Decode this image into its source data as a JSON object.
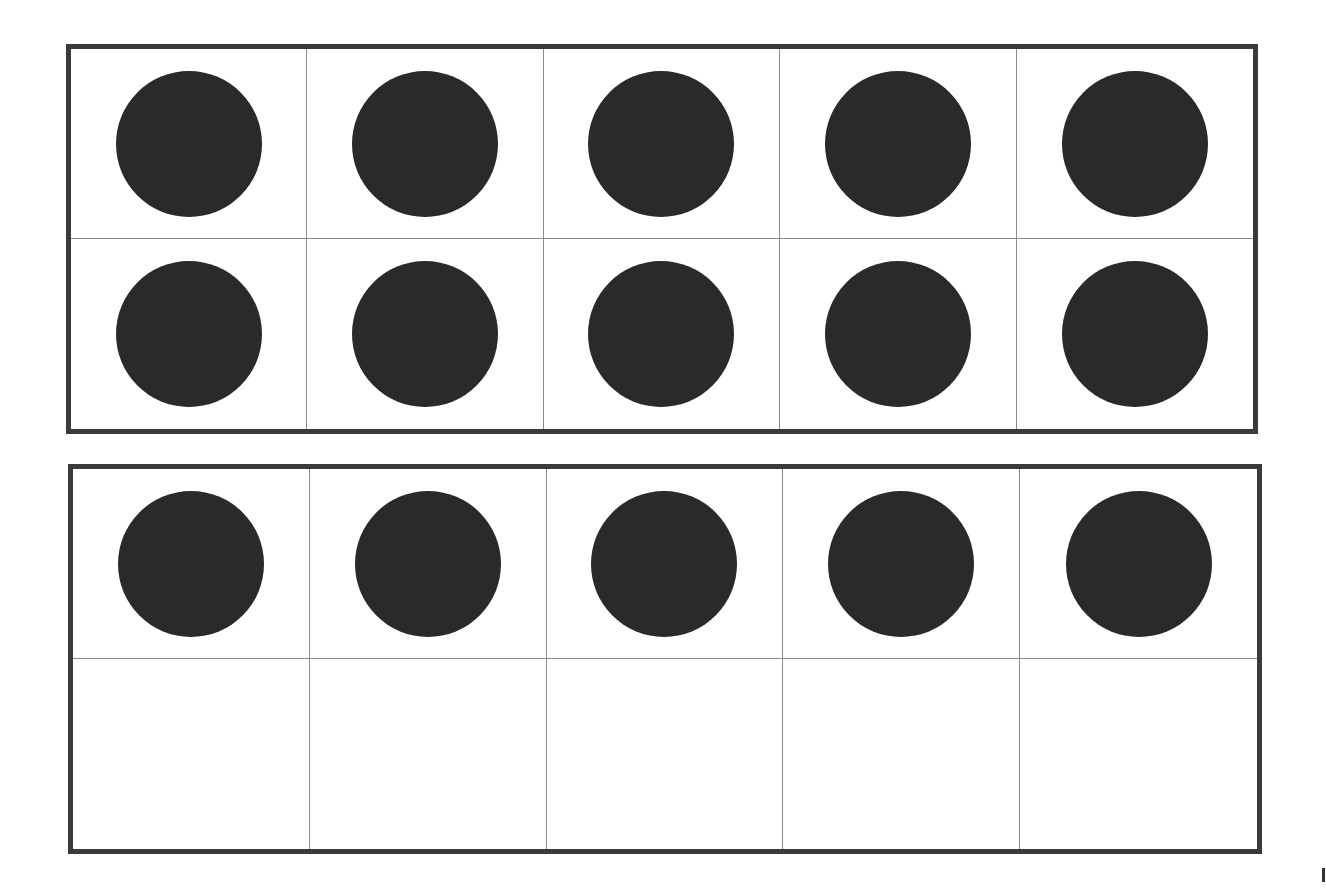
{
  "diagram": {
    "type": "ten-frames",
    "colors": {
      "frame_border": "#3a3a3a",
      "grid_line": "#8a8a8a",
      "counter": "#2a2a2a",
      "background": "#ffffff"
    },
    "frames": [
      {
        "id": "frame-1",
        "rows": 2,
        "cols": 5,
        "filled": [
          true,
          true,
          true,
          true,
          true,
          true,
          true,
          true,
          true,
          true
        ],
        "count": 10
      },
      {
        "id": "frame-2",
        "rows": 2,
        "cols": 5,
        "filled": [
          true,
          true,
          true,
          true,
          true,
          false,
          false,
          false,
          false,
          false
        ],
        "count": 5
      }
    ],
    "total": 15
  }
}
